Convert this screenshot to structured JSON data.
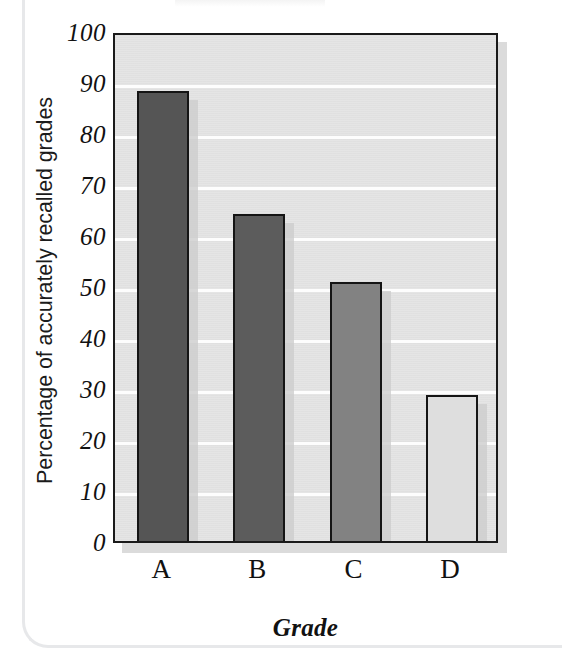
{
  "chart_data": {
    "type": "bar",
    "title": "",
    "subtitle": "",
    "categories": [
      "A",
      "B",
      "C",
      "D"
    ],
    "values": [
      89,
      65,
      51.5,
      29.5
    ],
    "series": [
      {
        "name": "Percentage of accurately recalled grades",
        "values": [
          89,
          65,
          51.5,
          29.5
        ]
      }
    ],
    "xlabel": "Grade",
    "ylabel": "Percentage of accurately recalled grades",
    "ylim": [
      0,
      100
    ],
    "ytick_values": [
      0,
      10,
      20,
      30,
      40,
      50,
      60,
      70,
      80,
      90,
      100
    ],
    "ytick_labels": [
      "0",
      "10",
      "20",
      "30",
      "40",
      "50",
      "60",
      "70",
      "80",
      "90",
      "100"
    ],
    "grid": true,
    "grid_axis": "y",
    "legend": false,
    "legend_position": "none",
    "bar_colors": [
      "#555555",
      "#5c5c5c",
      "#828282",
      "#dedede"
    ],
    "bar_edge_color": "#151515",
    "plot_background": "#e4e4e4",
    "gridline_color": "#fdfdfd",
    "page_background": "#ffffff"
  },
  "axes": {
    "y_title": "Percentage of accurately recalled grades",
    "x_title": "Grade",
    "y_ticks": [
      {
        "label": "100",
        "value": 100
      },
      {
        "label": "90",
        "value": 90
      },
      {
        "label": "80",
        "value": 80
      },
      {
        "label": "70",
        "value": 70
      },
      {
        "label": "60",
        "value": 60
      },
      {
        "label": "50",
        "value": 50
      },
      {
        "label": "40",
        "value": 40
      },
      {
        "label": "30",
        "value": 30
      },
      {
        "label": "20",
        "value": 20
      },
      {
        "label": "10",
        "value": 10
      },
      {
        "label": "0",
        "value": 0
      }
    ],
    "x_ticks": [
      {
        "label": "A"
      },
      {
        "label": "B"
      },
      {
        "label": "C"
      },
      {
        "label": "D"
      }
    ]
  },
  "bars": [
    {
      "category": "A",
      "value": 89,
      "color": "#555555"
    },
    {
      "category": "B",
      "value": 65,
      "color": "#5c5c5c"
    },
    {
      "category": "C",
      "value": 51.5,
      "color": "#828282"
    },
    {
      "category": "D",
      "value": 29.5,
      "color": "#dedede"
    }
  ]
}
